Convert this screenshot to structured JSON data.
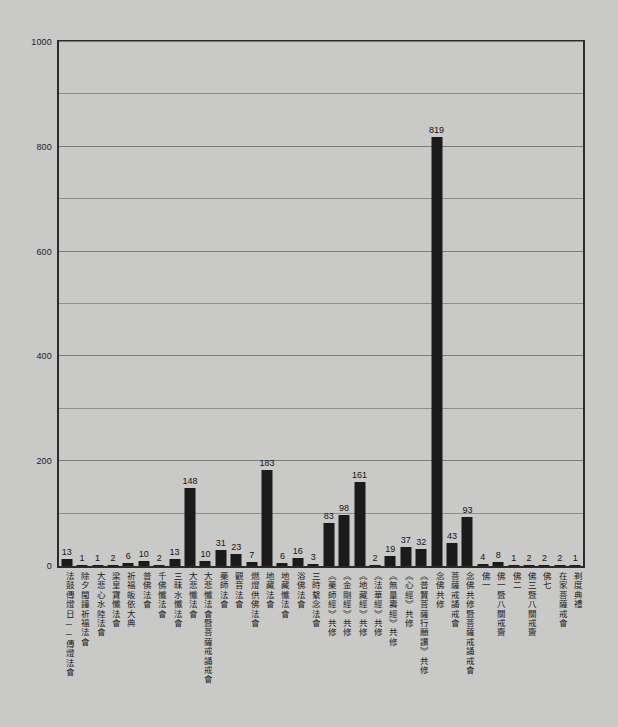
{
  "chart_data": {
    "type": "bar",
    "title": "",
    "subtitle": "",
    "xlabel": "",
    "ylabel": "",
    "ylim": [
      0,
      1000
    ],
    "grid": true,
    "legend": null,
    "y_ticks": [
      0,
      200,
      400,
      600,
      800,
      1000
    ],
    "y_minor_step": 100,
    "bar_color": "#1b1b1b",
    "background_color": "#c9c9c7",
    "axis_color": "#2b2b2b",
    "grid_color": "#8d8d8b",
    "categories": [
      "法鼓傳燈日──傳燈法會",
      "除夕閩鐘祈福法會",
      "大悲心水陸法會",
      "梁皇寶懺法會",
      "祈福皈依大典",
      "普佛法會",
      "千佛懺法會",
      "三昧水懺法會",
      "大悲懺法會",
      "大悲懺法會暨菩薩戒誦戒會",
      "藥師法會",
      "觀音法會",
      "燃燈供佛法會",
      "地藏法會",
      "地藏懺法會",
      "浴佛法會",
      "三時繫念法會",
      "《藥師經》共修",
      "《金剛經》共修",
      "《地藏經》共修",
      "《法華經》共修",
      "《無量壽經》共修",
      "《心經》共修",
      "《普賢菩薩行願讚》共修",
      "念佛共修",
      "菩薩戒誦戒會",
      "念佛共修暨菩薩戒誦戒會",
      "佛一",
      "佛一暨八關戒齋",
      "佛二",
      "佛三暨八關戒齋",
      "佛七",
      "在家菩薩戒會",
      "剃度典禮"
    ],
    "values": [
      13,
      1,
      1,
      2,
      6,
      10,
      2,
      13,
      148,
      10,
      31,
      23,
      7,
      183,
      6,
      16,
      3,
      83,
      98,
      161,
      2,
      19,
      37,
      32,
      819,
      43,
      93,
      4,
      8,
      1,
      2,
      2,
      2,
      1
    ],
    "value_labels": [
      "13",
      "1",
      "1",
      "2",
      "6",
      "10",
      "2",
      "13",
      "148",
      "10",
      "31",
      "23",
      "7",
      "183",
      "6",
      "16",
      "3",
      "83",
      "98",
      "161",
      "2",
      "19",
      "37",
      "32",
      "819",
      "43",
      "93",
      "4",
      "8",
      "1",
      "2",
      "2",
      "2",
      "1"
    ]
  }
}
